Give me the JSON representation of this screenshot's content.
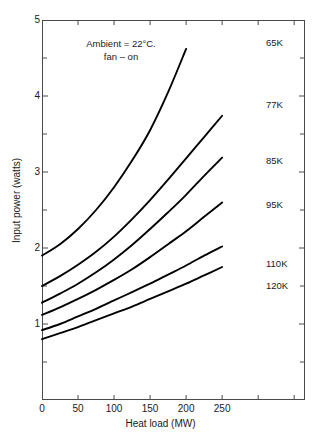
{
  "chart_data": {
    "type": "line",
    "title": "",
    "xlabel": "Heat load (MW)",
    "ylabel": "Input power (watts)",
    "xlim": [
      0,
      365
    ],
    "ylim": [
      0,
      5
    ],
    "grid": false,
    "legend_position": "right-inline-labels",
    "xticks": [
      0,
      50,
      100,
      150,
      200,
      250,
      300,
      350
    ],
    "xtick_labels": [
      "0",
      "50",
      "100",
      "150",
      "200",
      "250",
      "",
      ""
    ],
    "yticks": [
      0,
      0.5,
      1,
      1.5,
      2,
      2.5,
      3,
      3.5,
      4,
      4.5,
      5
    ],
    "ytick_labels": [
      "",
      "",
      "1",
      "",
      "2",
      "",
      "3",
      "",
      "4",
      "",
      "5"
    ],
    "annotations": [
      "Ambient = 22°C.",
      "fan – on"
    ],
    "x": [
      0,
      25,
      50,
      75,
      100,
      125,
      150,
      175,
      200,
      225,
      250
    ],
    "series": [
      {
        "name": "65K",
        "label": "65K",
        "values": [
          1.9,
          2.05,
          2.25,
          2.5,
          2.8,
          3.15,
          3.55,
          4.05,
          4.62,
          null,
          null
        ]
      },
      {
        "name": "77K",
        "label": "77K",
        "values": [
          1.5,
          1.63,
          1.78,
          1.95,
          2.15,
          2.38,
          2.63,
          2.9,
          3.18,
          3.46,
          3.74
        ]
      },
      {
        "name": "85K",
        "label": "85K",
        "values": [
          1.28,
          1.4,
          1.53,
          1.68,
          1.85,
          2.04,
          2.25,
          2.47,
          2.7,
          2.95,
          3.19
        ]
      },
      {
        "name": "95K",
        "label": "95K",
        "values": [
          1.12,
          1.22,
          1.33,
          1.45,
          1.58,
          1.72,
          1.88,
          2.05,
          2.22,
          2.41,
          2.6
        ]
      },
      {
        "name": "110K",
        "label": "110K",
        "values": [
          0.92,
          1.0,
          1.1,
          1.2,
          1.31,
          1.42,
          1.53,
          1.65,
          1.77,
          1.9,
          2.02
        ]
      },
      {
        "name": "120K",
        "label": "120K",
        "values": [
          0.8,
          0.88,
          0.96,
          1.05,
          1.14,
          1.23,
          1.33,
          1.43,
          1.53,
          1.64,
          1.75
        ]
      }
    ],
    "colors": {
      "curve": "#000000",
      "axis": "#4a4a4a",
      "text": "#1a1a1a",
      "background": "#ffffff"
    }
  }
}
